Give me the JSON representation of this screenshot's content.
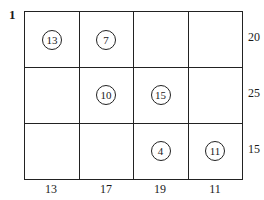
{
  "figure": {
    "label": "1",
    "row_capacities": [
      "20",
      "25",
      "15"
    ],
    "col_capacities": [
      "13",
      "17",
      "19",
      "11"
    ],
    "cells": [
      [
        "13",
        "7",
        "",
        ""
      ],
      [
        "",
        "10",
        "15",
        ""
      ],
      [
        "",
        "",
        "4",
        "11"
      ]
    ],
    "line_color": "#222222"
  }
}
